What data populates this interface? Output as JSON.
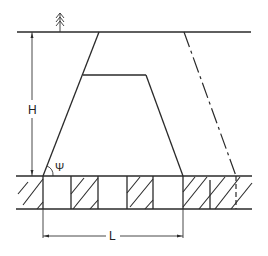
{
  "diagram": {
    "labels": {
      "height": "H",
      "length": "L",
      "angle": "Ψ"
    },
    "symbols": {
      "ground_marker": "tree-icon"
    },
    "colors": {
      "line": "#2a2a2a",
      "background": "#ffffff"
    }
  }
}
